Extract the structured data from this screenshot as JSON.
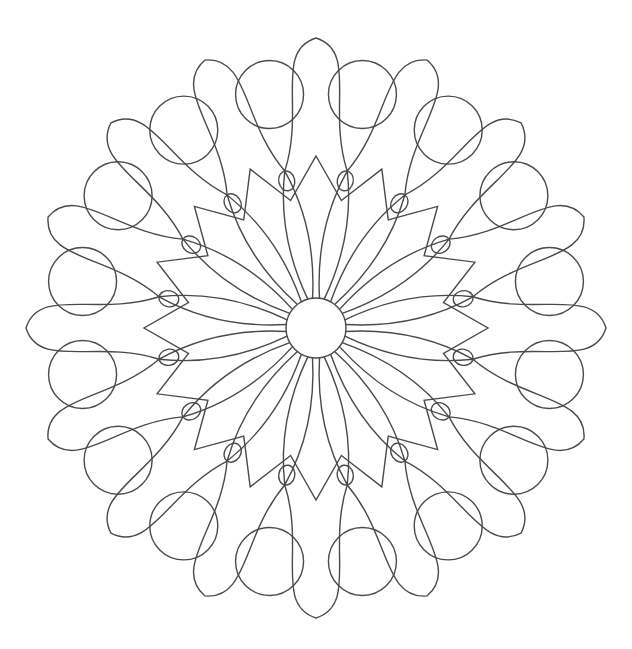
{
  "drawing": {
    "cx": 316,
    "cy": 328,
    "stroke": "#4a4a4a",
    "center_r": 30,
    "petals": 16,
    "outer_circles": 16,
    "teardrops": 16
  }
}
